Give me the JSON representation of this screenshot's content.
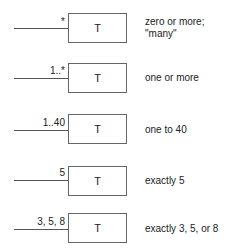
{
  "rows": [
    {
      "multiplicity": "*",
      "class": "T",
      "description": "zero or more;\n\"many\"",
      "desc_line1": "zero or more;",
      "desc_line2": "\"many\""
    },
    {
      "multiplicity": "1..*",
      "class": "T",
      "description": "one or more"
    },
    {
      "multiplicity": "1..40",
      "class": "T",
      "description": "one to 40"
    },
    {
      "multiplicity": "5",
      "class": "T",
      "description": "exactly 5"
    },
    {
      "multiplicity": "3, 5, 8",
      "class": "T",
      "description": "exactly 3, 5, or 8"
    }
  ]
}
